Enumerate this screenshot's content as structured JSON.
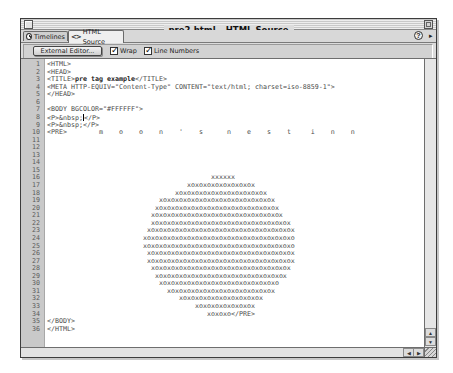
{
  "window": {
    "title": "pre2.html – HTML Source"
  },
  "tabs": [
    {
      "label": "Timelines",
      "icon": "clock-icon",
      "active": false
    },
    {
      "label": "HTML Source",
      "icon": "code-brackets-icon",
      "active": true
    }
  ],
  "tabbar": {
    "help_icon": "?",
    "menu_arrow": "▸"
  },
  "toolbar": {
    "external_editor_label": "External Editor...",
    "wrap": {
      "label": "Wrap",
      "checked": true
    },
    "line_numbers": {
      "label": "Line Numbers",
      "checked": true
    }
  },
  "scrollbar": {
    "up": "▲",
    "down": "▼",
    "left": "◀",
    "right": "▶"
  },
  "editor": {
    "lines": [
      {
        "n": "1",
        "parts": [
          {
            "text": "<HTML>"
          }
        ]
      },
      {
        "n": "2",
        "parts": [
          {
            "text": "<HEAD>"
          }
        ]
      },
      {
        "n": "3",
        "parts": [
          {
            "text": "<TITLE>"
          },
          {
            "text": "pre tag example",
            "bold": true
          },
          {
            "text": "</TITLE>"
          }
        ]
      },
      {
        "n": "4",
        "parts": [
          {
            "text": "<META HTTP-EQUIV=\"Content-Type\" CONTENT=\"text/html; charset=iso-8859-1\">"
          }
        ]
      },
      {
        "n": "5",
        "parts": [
          {
            "text": "</HEAD>"
          }
        ]
      },
      {
        "n": "6",
        "parts": [
          {
            "text": ""
          }
        ]
      },
      {
        "n": "7",
        "parts": [
          {
            "text": "<BODY BGCOLOR=\"#FFFFFF\">"
          }
        ]
      },
      {
        "n": "8",
        "parts": [
          {
            "text": "<P>&nbsp;"
          },
          {
            "cursor": true
          },
          {
            "text": "</P>"
          }
        ]
      },
      {
        "n": "9",
        "parts": [
          {
            "text": "<P>&nbsp;</P>"
          }
        ]
      },
      {
        "n": "10",
        "parts": [
          {
            "text": "<PRE>        m    o    o    n    '    s      n    e    s    t     i    n    n"
          }
        ]
      },
      {
        "n": "11",
        "parts": [
          {
            "text": ""
          }
        ]
      },
      {
        "n": "12",
        "parts": [
          {
            "text": ""
          }
        ]
      },
      {
        "n": "13",
        "parts": [
          {
            "text": ""
          }
        ]
      },
      {
        "n": "14",
        "parts": [
          {
            "text": ""
          }
        ]
      },
      {
        "n": "15",
        "parts": [
          {
            "text": ""
          }
        ]
      },
      {
        "n": "16",
        "indent": 41,
        "parts": [
          {
            "text": "xxxxxx"
          }
        ]
      },
      {
        "n": "17",
        "indent": 35,
        "parts": [
          {
            "text": "xoxoxoxoxoxoxoxox"
          }
        ]
      },
      {
        "n": "18",
        "indent": 32,
        "parts": [
          {
            "text": "xoxoxoxoxoxoxoxoxoxoxox"
          }
        ]
      },
      {
        "n": "19",
        "indent": 28,
        "parts": [
          {
            "text": "xoxoxoxoxoxoxoxoxoxoxoxoxoxox"
          }
        ]
      },
      {
        "n": "20",
        "indent": 27,
        "parts": [
          {
            "text": "xoxoxoxoxoxoxoxoxoxoxoxoxoxoxox"
          }
        ]
      },
      {
        "n": "21",
        "indent": 26,
        "parts": [
          {
            "text": "xoxoxoxoxoxoxoxoxoxoxoxoxoxoxoxox"
          }
        ]
      },
      {
        "n": "22",
        "indent": 26,
        "parts": [
          {
            "text": "xoxoxoxoxoxoxoxoxoxoxoxoxoxoxoxoxox"
          }
        ]
      },
      {
        "n": "23",
        "indent": 25,
        "parts": [
          {
            "text": "xoxoxoxoxoxoxoxoxoxoxoxoxoxoxoxoxoxox"
          }
        ]
      },
      {
        "n": "24",
        "indent": 24,
        "parts": [
          {
            "text": "xoxoxoxoxoxoxoxoxoxoxoxoxoxoxoxoxoxoxo"
          }
        ]
      },
      {
        "n": "25",
        "indent": 24,
        "parts": [
          {
            "text": "xoxoxoxoxoxoxoxoxoxoxoxoxoxoxoxoxoxoxo"
          }
        ]
      },
      {
        "n": "26",
        "indent": 25,
        "parts": [
          {
            "text": "xoxoxoxoxoxoxoxoxoxoxoxoxoxoxoxoxoxox"
          }
        ]
      },
      {
        "n": "27",
        "indent": 25,
        "parts": [
          {
            "text": "xoxoxoxoxoxoxoxoxoxoxoxoxoxoxoxoxoxox"
          }
        ]
      },
      {
        "n": "28",
        "indent": 26,
        "parts": [
          {
            "text": "xoxoxoxoxoxoxoxoxoxoxoxoxoxoxoxoxox"
          }
        ]
      },
      {
        "n": "29",
        "indent": 27,
        "parts": [
          {
            "text": "xoxoxoxoxoxoxoxoxoxoxoxoxoxoxoxox"
          }
        ]
      },
      {
        "n": "30",
        "indent": 28,
        "parts": [
          {
            "text": "xoxoxoxoxoxoxoxoxoxoxoxoxoxoxo"
          }
        ]
      },
      {
        "n": "31",
        "indent": 30,
        "parts": [
          {
            "text": "xoxoxoxoxoxoxoxoxoxoxoxoxox"
          }
        ]
      },
      {
        "n": "32",
        "indent": 33,
        "parts": [
          {
            "text": "xoxoxoxoxoxoxoxoxoxox"
          }
        ]
      },
      {
        "n": "33",
        "indent": 37,
        "parts": [
          {
            "text": "xoxoxoxoxoxoxox"
          }
        ]
      },
      {
        "n": "34",
        "indent": 40,
        "parts": [
          {
            "text": "xoxoxo</PRE>"
          }
        ]
      },
      {
        "n": "35",
        "parts": [
          {
            "text": "</BODY>"
          }
        ]
      },
      {
        "n": "36",
        "parts": [
          {
            "text": "</HTML>"
          }
        ]
      }
    ]
  }
}
